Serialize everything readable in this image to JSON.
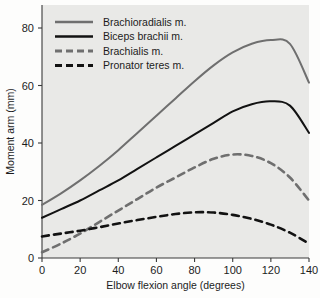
{
  "chart_data": {
    "type": "line",
    "title": "",
    "xlabel": "Elbow flexion angle (degrees)",
    "ylabel": "Moment arm (mm)",
    "xlim": [
      0,
      140
    ],
    "ylim": [
      0,
      88
    ],
    "xticks": [
      0,
      20,
      40,
      60,
      80,
      100,
      120,
      140
    ],
    "yticks": [
      0,
      20,
      40,
      60,
      80
    ],
    "grid": false,
    "legend_position": "top-left",
    "x": [
      0,
      10,
      20,
      30,
      40,
      50,
      60,
      70,
      80,
      90,
      100,
      110,
      120,
      130,
      140
    ],
    "series": [
      {
        "name": "Brachioradialis m.",
        "color": "#6f6f6f",
        "style": "solid",
        "values": [
          18.5,
          22.5,
          27.0,
          32.0,
          37.5,
          43.5,
          49.5,
          55.5,
          61.5,
          67.0,
          71.5,
          74.5,
          75.8,
          74.5,
          61.0
        ]
      },
      {
        "name": "Biceps brachii m.",
        "color": "#121212",
        "style": "solid",
        "values": [
          14.0,
          17.0,
          20.0,
          23.5,
          27.0,
          31.0,
          35.0,
          39.0,
          43.0,
          47.0,
          51.0,
          53.5,
          54.5,
          53.0,
          43.5
        ]
      },
      {
        "name": "Brachialis m.",
        "color": "#6f6f6f",
        "style": "dashed",
        "values": [
          2.0,
          5.0,
          8.5,
          12.5,
          16.5,
          20.5,
          24.5,
          28.0,
          31.5,
          34.5,
          36.0,
          35.5,
          33.0,
          28.0,
          20.0
        ]
      },
      {
        "name": "Pronator teres m.",
        "color": "#121212",
        "style": "dashed",
        "values": [
          7.5,
          8.5,
          9.5,
          10.7,
          12.0,
          13.2,
          14.3,
          15.3,
          15.9,
          15.8,
          15.0,
          13.6,
          11.6,
          8.8,
          5.0
        ]
      }
    ],
    "annotations": []
  }
}
